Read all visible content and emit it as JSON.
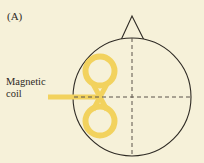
{
  "figure": {
    "panel_label": "(A)",
    "coil_label_line1": "Magnetic",
    "coil_label_line2": "coil"
  },
  "colors": {
    "background": "#f6f1d9",
    "coil": "#f2d25e",
    "outline": "#2e2a24",
    "dashes": "#5a534a"
  }
}
